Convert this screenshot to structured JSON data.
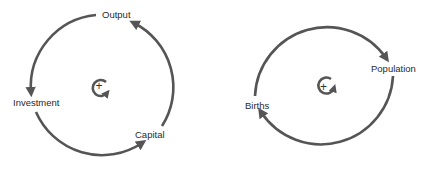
{
  "diagrams": [
    {
      "name": "capital-loop",
      "polarity": "+",
      "loop_type": "reinforcing",
      "nodes": [
        "Output",
        "Investment",
        "Capital"
      ],
      "links": [
        {
          "from": "Output",
          "to": "Investment"
        },
        {
          "from": "Investment",
          "to": "Capital"
        },
        {
          "from": "Capital",
          "to": "Output"
        }
      ]
    },
    {
      "name": "population-loop",
      "polarity": "+",
      "loop_type": "reinforcing",
      "nodes": [
        "Births",
        "Population"
      ],
      "links": [
        {
          "from": "Births",
          "to": "Population"
        },
        {
          "from": "Population",
          "to": "Births"
        }
      ]
    }
  ],
  "colors": {
    "arrow": "#555555",
    "text": "#2a2a2a",
    "background": "#ffffff"
  }
}
